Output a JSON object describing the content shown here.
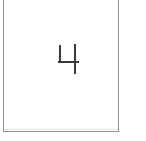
{
  "image": {
    "kind": "scanned-handwritten-digit-cell",
    "width": 146,
    "height": 141,
    "background_color": "#ffffff"
  },
  "cell": {
    "name": "digit-box",
    "border_color": "#8f9194",
    "border_width": 1,
    "fill_color": "#ffffff",
    "top_edge_cropped": true
  },
  "digit": {
    "value": "4",
    "style": "handwritten open-top four",
    "ink_color": "#3a3a3c",
    "stroke_width": 2,
    "strokes": [
      {
        "name": "left-vertical",
        "x1": 4,
        "y1": 4,
        "x2": 4,
        "y2": 20
      },
      {
        "name": "crossbar",
        "x1": 3,
        "y1": 20,
        "x2": 22,
        "y2": 20
      },
      {
        "name": "stem",
        "x1": 19,
        "y1": 3,
        "x2": 19,
        "y2": 31
      }
    ]
  }
}
